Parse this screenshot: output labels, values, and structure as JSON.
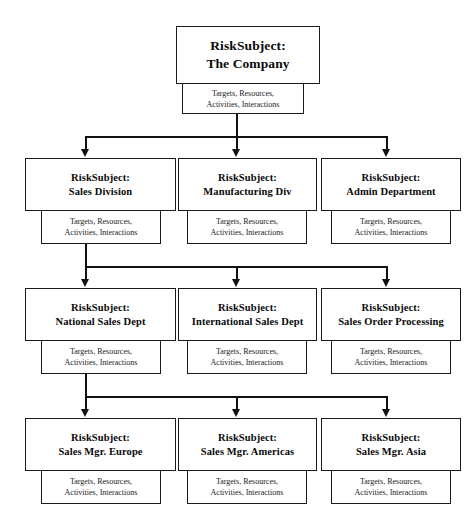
{
  "diagram": {
    "prefix": "RiskSubject:",
    "subtitle_line1": "Targets, Resources,",
    "subtitle_line2": "Activities, Interactions",
    "line_color": "#111111",
    "box_border_color": "#1a1a1a",
    "background": "#ffffff"
  },
  "levels": [
    {
      "level": 1,
      "nodes": [
        {
          "prefix": "RiskSubject:",
          "name": "The Company",
          "sub1": "Targets, Resources,",
          "sub2": "Activities, Interactions"
        }
      ]
    },
    {
      "level": 2,
      "nodes": [
        {
          "prefix": "RiskSubject:",
          "name": "Sales Division",
          "sub1": "Targets, Resources,",
          "sub2": "Activities, Interactions"
        },
        {
          "prefix": "RiskSubject:",
          "name": "Manufacturing Div",
          "sub1": "Targets, Resources,",
          "sub2": "Activities, Interactions"
        },
        {
          "prefix": "RiskSubject:",
          "name": "Admin Department",
          "sub1": "Targets, Resources,",
          "sub2": "Activities, Interactions"
        }
      ]
    },
    {
      "level": 3,
      "nodes": [
        {
          "prefix": "RiskSubject:",
          "name": "National Sales Dept",
          "sub1": "Targets, Resources,",
          "sub2": "Activities, Interactions"
        },
        {
          "prefix": "RiskSubject:",
          "name": "International Sales Dept",
          "sub1": "Targets, Resources,",
          "sub2": "Activities, Interactions"
        },
        {
          "prefix": "RiskSubject:",
          "name": "Sales Order Processing",
          "sub1": "Targets, Resources,",
          "sub2": "Activities, Interactions"
        }
      ]
    },
    {
      "level": 4,
      "nodes": [
        {
          "prefix": "RiskSubject:",
          "name": "Sales Mgr. Europe",
          "sub1": "Targets, Resources,",
          "sub2": "Activities, Interactions"
        },
        {
          "prefix": "RiskSubject:",
          "name": "Sales Mgr. Americas",
          "sub1": "Targets, Resources,",
          "sub2": "Activities, Interactions"
        },
        {
          "prefix": "RiskSubject:",
          "name": "Sales Mgr. Asia",
          "sub1": "Targets, Resources,",
          "sub2": "Activities, Interactions"
        }
      ]
    }
  ]
}
